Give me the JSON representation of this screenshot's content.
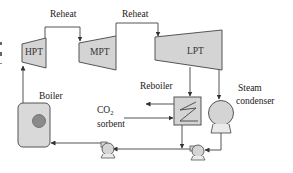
{
  "diagram": {
    "type": "process-flow",
    "colors": {
      "component_fill": "#d4d4d4",
      "stroke": "#555555",
      "boiler_fill": "#d9d9d9",
      "boiler_core": "#8a8a8a",
      "text": "#222222",
      "background": "#ffffff"
    },
    "labels": {
      "reheat_1": "Reheat",
      "reheat_2": "Reheat",
      "hpt": "HPT",
      "mpt": "MPT",
      "lpt": "LPT",
      "boiler": "Boiler",
      "reboiler": "Reboiler",
      "co2": "CO",
      "co2_sub": "2",
      "sorbent": "sorbent",
      "steam": "Steam",
      "condenser": "condenser",
      "left_edge_fragments": [
        "e",
        "n",
        "-"
      ]
    },
    "nodes": [
      {
        "id": "hpt",
        "label": "HPT",
        "kind": "turbine"
      },
      {
        "id": "mpt",
        "label": "MPT",
        "kind": "turbine"
      },
      {
        "id": "lpt",
        "label": "LPT",
        "kind": "turbine"
      },
      {
        "id": "boiler",
        "label": "Boiler",
        "kind": "boiler"
      },
      {
        "id": "reboiler",
        "label": "Reboiler",
        "kind": "heat-exchanger"
      },
      {
        "id": "condenser",
        "label": "Steam condenser",
        "kind": "condenser"
      },
      {
        "id": "pump1",
        "label": "",
        "kind": "pump"
      },
      {
        "id": "pump2",
        "label": "",
        "kind": "pump"
      }
    ],
    "edges": [
      {
        "from": "boiler",
        "to": "hpt",
        "label": ""
      },
      {
        "from": "hpt",
        "to": "mpt",
        "label": "Reheat"
      },
      {
        "from": "mpt",
        "to": "lpt",
        "label": "Reheat"
      },
      {
        "from": "lpt",
        "to": "reboiler",
        "label": ""
      },
      {
        "from": "lpt",
        "to": "condenser",
        "label": ""
      },
      {
        "from": "condenser",
        "to": "pump2",
        "label": ""
      },
      {
        "from": "reboiler",
        "to": "pump2",
        "label": ""
      },
      {
        "from": "pump2",
        "to": "pump1",
        "label": ""
      },
      {
        "from": "pump1",
        "to": "boiler",
        "label": ""
      },
      {
        "from": "co2_sorbent_in",
        "to": "reboiler",
        "label": "CO2 sorbent"
      },
      {
        "from": "reboiler",
        "to": "sorbent_out",
        "label": ""
      }
    ]
  }
}
